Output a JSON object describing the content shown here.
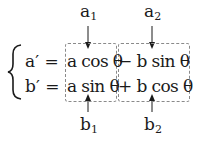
{
  "labels": {
    "a1": {
      "base": "a",
      "sub": "1"
    },
    "a2": {
      "base": "a",
      "sub": "2"
    },
    "b1": {
      "base": "b",
      "sub": "1"
    },
    "b2": {
      "base": "b",
      "sub": "2"
    }
  },
  "equations": [
    {
      "lhs": "a′ =",
      "term1": "a cos θ",
      "term2": "− b sin θ"
    },
    {
      "lhs": "b′ =",
      "term1": "a sin θ",
      "term2": "+ b cos θ"
    }
  ],
  "colors": {
    "text": "#1a1a1a",
    "box_border": "#8a8a8a"
  }
}
